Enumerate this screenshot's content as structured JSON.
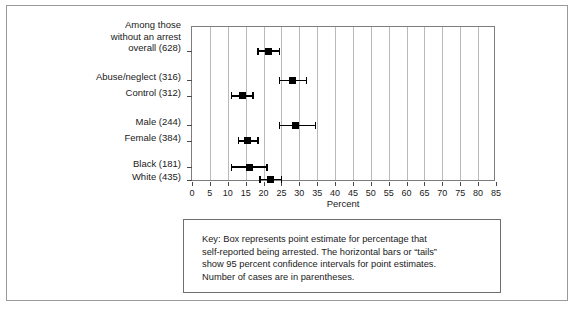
{
  "figure": {
    "x_axis_title": "Percent"
  },
  "key": {
    "lines": [
      "Key: Box represents point estimate for percentage that",
      "self-reported being arrested. The horizontal bars or “tails”",
      "show 95 percent confidence intervals for point estimates.",
      "Number of cases are in parentheses."
    ]
  },
  "chart_data": {
    "type": "scatter",
    "title": "",
    "subtitle": "",
    "xlabel": "Percent",
    "ylabel": "",
    "xlim": [
      0,
      85
    ],
    "xticks": [
      0,
      5,
      10,
      15,
      20,
      25,
      30,
      35,
      40,
      45,
      50,
      55,
      60,
      65,
      70,
      75,
      80,
      85
    ],
    "xticklabels": [
      "0",
      "5",
      "10",
      "15",
      "20",
      "25",
      "30",
      "35",
      "40",
      "45",
      "50",
      "55",
      "60",
      "65",
      "70",
      "75",
      "80",
      "85"
    ],
    "grid": true,
    "grid_axis": "x",
    "legend": "none",
    "orientation": "horizontal",
    "marker": "square",
    "error_bars": "95% confidence interval",
    "categories": [
      "Among those\nwithout an arrest\noverall (628)",
      "Abuse/neglect (316)",
      "Control (312)",
      "Male (244)",
      "Female (384)",
      "Black (181)",
      "White (435)"
    ],
    "points": [
      {
        "label": "Among those\nwithout an arrest\noverall (628)",
        "n": 628,
        "estimate": 21.5,
        "ci_low": 18.5,
        "ci_high": 24.5,
        "row": 0
      },
      {
        "label": "Abuse/neglect (316)",
        "n": 316,
        "estimate": 28.0,
        "ci_low": 24.5,
        "ci_high": 32.0,
        "row": 1
      },
      {
        "label": "Control (312)",
        "n": 312,
        "estimate": 14.0,
        "ci_low": 11.0,
        "ci_high": 17.0,
        "row": 2
      },
      {
        "label": "Male (244)",
        "n": 244,
        "estimate": 29.0,
        "ci_low": 24.5,
        "ci_high": 34.5,
        "row": 3
      },
      {
        "label": "Female (384)",
        "n": 384,
        "estimate": 15.5,
        "ci_low": 13.0,
        "ci_high": 18.5,
        "row": 4
      },
      {
        "label": "Black (181)",
        "n": 181,
        "estimate": 16.0,
        "ci_low": 11.0,
        "ci_high": 21.0,
        "row": 5
      },
      {
        "label": "White (435)",
        "n": 435,
        "estimate": 22.0,
        "ci_low": 19.0,
        "ci_high": 25.0,
        "row": 6
      }
    ],
    "row_y_fractions": [
      0.155,
      0.345,
      0.445,
      0.635,
      0.735,
      0.905,
      0.985
    ],
    "colors": {
      "marker": "#000000",
      "error_bar": "#000000",
      "gridline": "#b9b9b9",
      "axis": "#7d7d7d",
      "background": "#ffffff",
      "text": "#1a1a1a"
    }
  }
}
